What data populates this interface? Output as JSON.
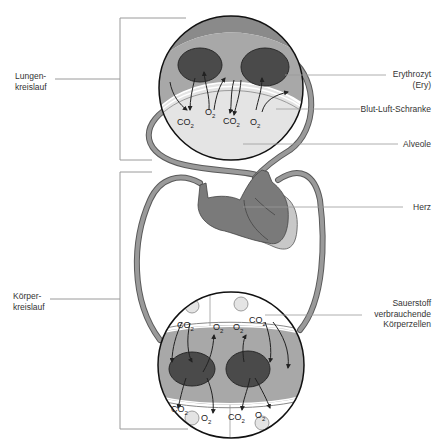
{
  "diagram": {
    "labels_left": {
      "lungenkreislauf": [
        "Lungen-",
        "kreislauf"
      ],
      "koerperkreislauf": [
        "Körper-",
        "kreislauf"
      ]
    },
    "labels_right": {
      "erythrozyt": [
        "Erythrozyt",
        "(Ery)"
      ],
      "blut_luft_schranke": "Blut-Luft-Schranke",
      "alveole": "Alveole",
      "herz": "Herz",
      "koerperzellen": [
        "Sauerstoff",
        "verbrauchende",
        "Körperzellen"
      ]
    },
    "gas_labels": {
      "co2": "CO",
      "o2": "O",
      "subscript": "2"
    },
    "colors": {
      "vessel": "#8a8a8a",
      "vessel_dark": "#5a5a5a",
      "plasma": "#a8a8a8",
      "erythrocyte": "#4a4a4a",
      "alveole": "#e4e4e4",
      "heart": "#7a7a7a",
      "heart_light": "#c8c8c8",
      "leader_line": "#9a9a9a",
      "outline": "#111111"
    }
  }
}
